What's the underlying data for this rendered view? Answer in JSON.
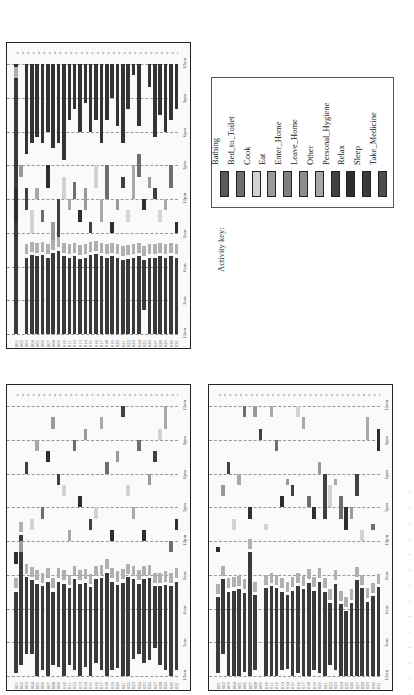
{
  "figure": {
    "legend_title": "Activity key:",
    "caption_fragment": ". . . . . . . . . . . . . ."
  },
  "legend": [
    {
      "label": "Bathing",
      "color": "#5a5a5a"
    },
    {
      "label": "Bed_to_Toilet",
      "color": "#6e6e6e"
    },
    {
      "label": "Cook",
      "color": "#d2d2d2"
    },
    {
      "label": "Eat",
      "color": "#9a9a9a"
    },
    {
      "label": "Enter_Home",
      "color": "#808080"
    },
    {
      "label": "Leave_Home",
      "color": "#8c8c8c"
    },
    {
      "label": "Other",
      "color": "#a8a8a8"
    },
    {
      "label": "Personal_Hygiene",
      "color": "#404040"
    },
    {
      "label": "Relax",
      "color": "#2e2e2e"
    },
    {
      "label": "Sleep",
      "color": "#3a3a3a"
    },
    {
      "label": "Take_Medicine",
      "color": "#4e4e4e"
    }
  ],
  "chart_data": [
    {
      "type": "heatmap",
      "title": "Deployment A (top-left)",
      "xlabel": "Day",
      "ylabel": "Time of day",
      "x": [
        "001",
        "002",
        "003",
        "004",
        "005",
        "006",
        "007",
        "008",
        "009",
        "010",
        "011",
        "012",
        "013",
        "014",
        "015",
        "016",
        "017",
        "018",
        "019",
        "020",
        "021",
        "022",
        "023",
        "024",
        "025",
        "026",
        "027",
        "028",
        "029",
        "030",
        "031"
      ],
      "time_ticks": [
        "12am",
        "3am",
        "6am",
        "9am",
        "12pm",
        "3pm",
        "6pm",
        "9pm",
        "12am"
      ],
      "ylim": [
        0,
        24
      ],
      "sleep_night": [
        [
          0,
          22.5
        ],
        [
          0,
          0
        ],
        [
          0,
          6.8
        ],
        [
          0,
          7
        ],
        [
          0,
          6.9
        ],
        [
          0,
          7
        ],
        [
          0,
          6.8
        ],
        [
          0,
          7.2
        ],
        [
          0,
          7.4
        ],
        [
          0,
          6.9
        ],
        [
          0,
          6.8
        ],
        [
          0,
          6.9
        ],
        [
          0,
          6.7
        ],
        [
          0,
          6.8
        ],
        [
          0,
          7
        ],
        [
          0,
          7.1
        ],
        [
          0,
          6.9
        ],
        [
          0,
          6.8
        ],
        [
          0,
          6.9
        ],
        [
          0,
          6.8
        ],
        [
          0,
          6.6
        ],
        [
          0,
          6.7
        ],
        [
          0,
          6.8
        ],
        [
          0,
          6.9
        ],
        [
          2.1,
          6.6
        ],
        [
          0,
          6.8
        ],
        [
          0,
          6.8
        ],
        [
          0,
          6.9
        ],
        [
          0,
          6.8
        ],
        [
          0,
          6.9
        ],
        [
          0,
          6.8
        ]
      ],
      "sleep_evening": [
        [
          22.5,
          24
        ],
        [
          0,
          0
        ],
        [
          16,
          24
        ],
        [
          17,
          24
        ],
        [
          17.5,
          24
        ],
        [
          17,
          24
        ],
        [
          18,
          24
        ],
        [
          16.5,
          24
        ],
        [
          17,
          24
        ],
        [
          15.5,
          24
        ],
        [
          19,
          24
        ],
        [
          20,
          24
        ],
        [
          18,
          24
        ],
        [
          20.5,
          24
        ],
        [
          18,
          24
        ],
        [
          19,
          24
        ],
        [
          17,
          24
        ],
        [
          19,
          24
        ],
        [
          21,
          24
        ],
        [
          18.5,
          24
        ],
        [
          17,
          24
        ],
        [
          20,
          24
        ],
        [
          23,
          24
        ],
        [
          18.5,
          24
        ],
        [
          0,
          0
        ],
        [
          22,
          24
        ],
        [
          17.5,
          24
        ],
        [
          19.5,
          24
        ],
        [
          18,
          24
        ],
        [
          19,
          24
        ],
        [
          20,
          24
        ]
      ],
      "day_activities": [
        [
          10,
          13
        ],
        [
          14,
          15
        ],
        [
          11,
          13
        ],
        [
          9,
          11
        ],
        [
          12,
          13
        ],
        [
          10,
          11
        ],
        [
          13,
          15
        ],
        [
          8,
          10
        ],
        [
          8.5,
          12
        ],
        [
          12,
          14
        ],
        [
          11,
          12
        ],
        [
          12,
          13.5
        ],
        [
          10,
          11
        ],
        [
          11,
          13
        ],
        [
          9,
          10
        ],
        [
          13,
          15
        ],
        [
          10,
          12
        ],
        [
          12,
          15
        ],
        [
          9,
          10
        ],
        [
          11,
          12
        ],
        [
          13,
          14
        ],
        [
          10,
          11
        ],
        [
          12,
          15
        ],
        [
          14,
          16
        ],
        [
          11,
          12
        ],
        [
          13,
          14
        ],
        [
          12,
          13
        ],
        [
          10,
          11
        ],
        [
          11,
          12
        ],
        [
          13,
          15
        ],
        [
          9,
          10
        ]
      ]
    },
    {
      "type": "heatmap",
      "title": "Deployment B (bottom-left)",
      "xlabel": "Day",
      "ylabel": "Time of day",
      "x": [
        "001",
        "002",
        "003",
        "004",
        "005",
        "006",
        "007",
        "008",
        "009",
        "010",
        "011",
        "012",
        "013",
        "014",
        "015",
        "016",
        "017",
        "018",
        "019",
        "020",
        "021",
        "022",
        "023",
        "024",
        "025",
        "026",
        "027",
        "028",
        "029",
        "030",
        "031"
      ],
      "time_ticks": [
        "12am",
        "3am",
        "6am",
        "9am",
        "12pm",
        "3pm",
        "6pm",
        "9pm",
        "12am"
      ],
      "ylim": [
        0,
        24
      ],
      "sleep_night": [
        [
          0.3,
          7.5
        ],
        [
          1,
          12.5
        ],
        [
          2,
          8.8
        ],
        [
          2,
          8.5
        ],
        [
          0,
          8.2
        ],
        [
          0.5,
          8
        ],
        [
          0,
          8.4
        ],
        [
          1,
          7.5
        ],
        [
          0.8,
          8.4
        ],
        [
          0,
          8.2
        ],
        [
          1,
          7.8
        ],
        [
          0.5,
          8.6
        ],
        [
          0,
          8.2
        ],
        [
          0.8,
          8.3
        ],
        [
          0,
          7.9
        ],
        [
          1.2,
          8.6
        ],
        [
          0.5,
          8.7
        ],
        [
          0,
          9.2
        ],
        [
          0.5,
          8.4
        ],
        [
          0.7,
          8.1
        ],
        [
          0,
          8.3
        ],
        [
          0,
          8.8
        ],
        [
          1.5,
          8.6
        ],
        [
          2,
          8.2
        ],
        [
          1.2,
          8.6
        ],
        [
          1.4,
          8.7
        ],
        [
          2.5,
          8
        ],
        [
          1,
          8
        ],
        [
          0.5,
          8.1
        ],
        [
          0,
          8
        ],
        [
          0.5,
          8.4
        ]
      ],
      "day_activities": [
        [
          10,
          11
        ],
        [
          11,
          12
        ],
        [
          18,
          19
        ],
        [
          13,
          14
        ],
        [
          20,
          21
        ],
        [
          14,
          15
        ],
        [
          19,
          20
        ],
        [
          22,
          23
        ],
        [
          17,
          18
        ],
        [
          16,
          17
        ],
        [
          12,
          13
        ],
        [
          20,
          21
        ],
        [
          15,
          16
        ],
        [
          21,
          22
        ],
        [
          13,
          14
        ],
        [
          14,
          15
        ],
        [
          22,
          23
        ],
        [
          18,
          19
        ],
        [
          12,
          13
        ],
        [
          19,
          20
        ],
        [
          23,
          24
        ],
        [
          16,
          17
        ],
        [
          14,
          15
        ],
        [
          20,
          21
        ],
        [
          12,
          13
        ],
        [
          17,
          18
        ],
        [
          19,
          20
        ],
        [
          21,
          22
        ],
        [
          22,
          24
        ],
        [
          11,
          12
        ],
        [
          13,
          14
        ]
      ]
    },
    {
      "type": "heatmap",
      "title": "Deployment C (bottom-right)",
      "xlabel": "Day",
      "ylabel": "Time of day",
      "x": [
        "001",
        "002",
        "003",
        "004",
        "005",
        "006",
        "007",
        "008",
        "009",
        "010",
        "011",
        "012",
        "013",
        "014",
        "015",
        "016",
        "017",
        "018",
        "019",
        "020",
        "021",
        "022",
        "023",
        "024",
        "025",
        "026",
        "027",
        "028",
        "029",
        "030",
        "031"
      ],
      "time_ticks": [
        "12am",
        "3am",
        "6am",
        "9am",
        "12pm",
        "3pm",
        "6pm",
        "9pm",
        "12am"
      ],
      "ylim": [
        0,
        24
      ],
      "sleep_night": [
        [
          0.3,
          7
        ],
        [
          2,
          8.6
        ],
        [
          0,
          7.5
        ],
        [
          0,
          7.6
        ],
        [
          0,
          7.7
        ],
        [
          0.4,
          7.4
        ],
        [
          0,
          11
        ],
        [
          0.5,
          7.2
        ],
        [
          0,
          0
        ],
        [
          0,
          7.8
        ],
        [
          0,
          8
        ],
        [
          0,
          7.8
        ],
        [
          0.5,
          7.5
        ],
        [
          0.6,
          7.2
        ],
        [
          0,
          7.6
        ],
        [
          0.3,
          8
        ],
        [
          0,
          7.7
        ],
        [
          0,
          8.3
        ],
        [
          0.5,
          7.6
        ],
        [
          0.3,
          8.4
        ],
        [
          0,
          7.5
        ],
        [
          1,
          6.5
        ],
        [
          0.5,
          8.2
        ],
        [
          0,
          6.4
        ],
        [
          0,
          5.8
        ],
        [
          0,
          6.5
        ],
        [
          0,
          8.5
        ],
        [
          0,
          7.8
        ],
        [
          0,
          6.6
        ],
        [
          0,
          7.1
        ],
        [
          0,
          7.9
        ]
      ],
      "day_activities": [
        [
          11,
          11.5
        ],
        [
          16,
          17
        ],
        [
          18,
          19
        ],
        [
          13,
          14
        ],
        [
          17,
          18
        ],
        [
          23,
          24
        ],
        [
          14,
          15
        ],
        [
          23,
          24
        ],
        [
          21,
          22
        ],
        [
          13,
          13.5
        ],
        [
          23,
          24
        ],
        [
          20,
          21
        ],
        [
          15,
          16
        ],
        [
          17,
          17.5
        ],
        [
          16,
          17
        ],
        [
          23,
          24
        ],
        [
          22,
          23
        ],
        [
          15,
          16
        ],
        [
          14,
          15
        ],
        [
          18,
          19
        ],
        [
          14,
          18
        ],
        [
          15,
          17
        ],
        [
          17,
          17.5
        ],
        [
          14,
          16
        ],
        [
          13,
          15
        ],
        [
          14,
          15
        ],
        [
          16,
          18
        ],
        [
          12,
          13
        ],
        [
          21,
          23
        ],
        [
          13,
          13.5
        ],
        [
          20,
          22
        ]
      ]
    }
  ]
}
